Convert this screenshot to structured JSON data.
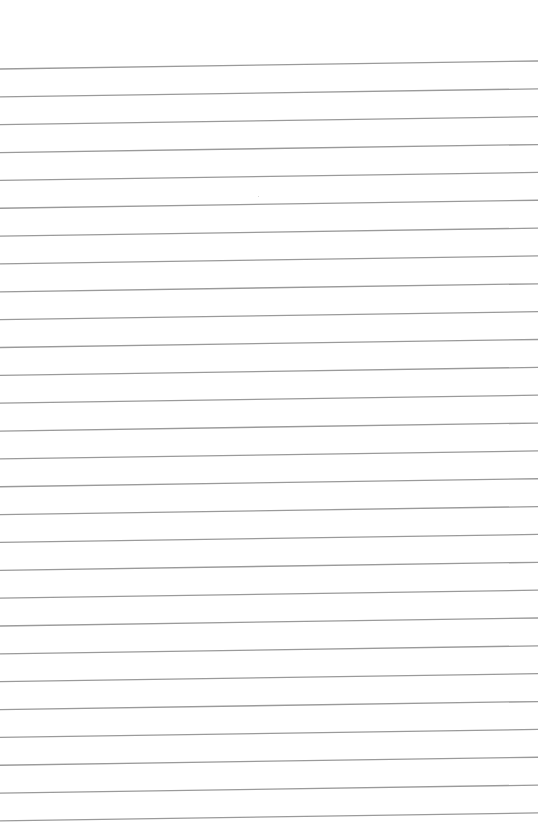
{
  "page": {
    "type": "lined-paper",
    "background_color": "#ffffff",
    "line_color": "#9a9a9a",
    "line_count": 28,
    "first_line_left_y": 69,
    "first_line_right_y": 61,
    "line_spacing": 27.85,
    "line_thickness": 1.3
  }
}
